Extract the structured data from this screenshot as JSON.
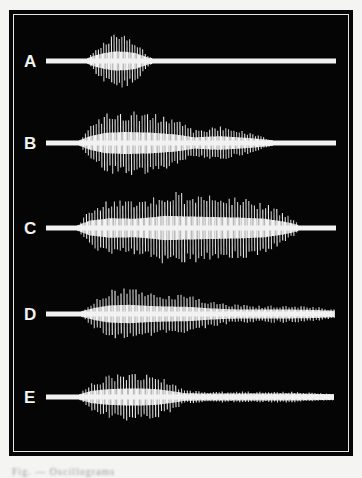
{
  "figure": {
    "background": "#050505",
    "trace_color": "#f2f2f2",
    "frame_inner_line": "#e8e8e8",
    "traces": [
      {
        "label": "A",
        "baseline_y": 61,
        "start_x": 46,
        "end_x": 336,
        "burst_start": 88,
        "burst_end": 152,
        "envelope": [
          [
            88,
            3
          ],
          [
            95,
            12
          ],
          [
            105,
            20
          ],
          [
            115,
            25
          ],
          [
            125,
            24
          ],
          [
            135,
            20
          ],
          [
            142,
            12
          ],
          [
            148,
            5
          ],
          [
            152,
            3
          ],
          [
            160,
            2
          ]
        ],
        "spacing": 2.6
      },
      {
        "label": "B",
        "baseline_y": 143,
        "start_x": 46,
        "end_x": 336,
        "burst_start": 80,
        "burst_end": 272,
        "envelope": [
          [
            80,
            3
          ],
          [
            90,
            16
          ],
          [
            105,
            27
          ],
          [
            125,
            30
          ],
          [
            150,
            28
          ],
          [
            175,
            22
          ],
          [
            195,
            12
          ],
          [
            205,
            14
          ],
          [
            220,
            16
          ],
          [
            240,
            12
          ],
          [
            255,
            8
          ],
          [
            272,
            3
          ]
        ],
        "spacing": 2.7
      },
      {
        "label": "C",
        "baseline_y": 228,
        "start_x": 46,
        "end_x": 336,
        "burst_start": 78,
        "burst_end": 298,
        "envelope": [
          [
            78,
            3
          ],
          [
            90,
            18
          ],
          [
            110,
            26
          ],
          [
            135,
            24
          ],
          [
            155,
            30
          ],
          [
            165,
            34
          ],
          [
            185,
            32
          ],
          [
            210,
            30
          ],
          [
            240,
            28
          ],
          [
            265,
            24
          ],
          [
            285,
            14
          ],
          [
            298,
            4
          ]
        ],
        "spacing": 2.8
      },
      {
        "label": "D",
        "baseline_y": 314,
        "start_x": 46,
        "end_x": 334,
        "burst_start": 82,
        "burst_end": 334,
        "envelope": [
          [
            82,
            3
          ],
          [
            95,
            14
          ],
          [
            110,
            22
          ],
          [
            130,
            24
          ],
          [
            150,
            20
          ],
          [
            170,
            18
          ],
          [
            190,
            17
          ],
          [
            210,
            12
          ],
          [
            230,
            9
          ],
          [
            260,
            8
          ],
          [
            290,
            8
          ],
          [
            315,
            7
          ],
          [
            325,
            5
          ],
          [
            334,
            4
          ]
        ],
        "spacing": 3.0
      },
      {
        "label": "E",
        "baseline_y": 397,
        "start_x": 46,
        "end_x": 334,
        "burst_start": 80,
        "burst_end": 334,
        "envelope": [
          [
            80,
            3
          ],
          [
            92,
            14
          ],
          [
            110,
            20
          ],
          [
            135,
            22
          ],
          [
            155,
            20
          ],
          [
            170,
            14
          ],
          [
            185,
            6
          ],
          [
            210,
            5
          ],
          [
            250,
            5
          ],
          [
            290,
            5
          ],
          [
            334,
            3
          ]
        ],
        "spacing": 2.9
      }
    ]
  },
  "caption": {
    "text": "Fig. — Oscillograms"
  }
}
